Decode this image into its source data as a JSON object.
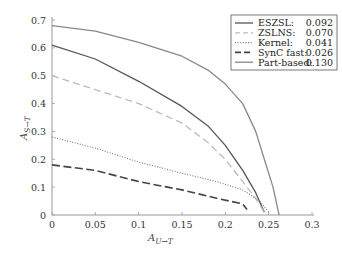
{
  "chart_data": {
    "type": "line",
    "title": "",
    "xlabel": "A_{U→T}",
    "ylabel": "A_{S→T}",
    "xlim": [
      0,
      0.3
    ],
    "ylim": [
      0,
      0.7
    ],
    "x_ticks": [
      "0",
      "0.05",
      "0.1",
      "0.15",
      "0.2",
      "0.25",
      "0.3"
    ],
    "y_ticks": [
      "0",
      "0.1",
      "0.2",
      "0.3",
      "0.4",
      "0.5",
      "0.6",
      "0.7"
    ],
    "grid": false,
    "legend_position": "upper right",
    "series": [
      {
        "name": "ESZSL:",
        "auc": "0.092",
        "style": "solid",
        "color": "#555555",
        "points": [
          [
            0,
            0.61
          ],
          [
            0.05,
            0.56
          ],
          [
            0.1,
            0.48
          ],
          [
            0.15,
            0.39
          ],
          [
            0.18,
            0.32
          ],
          [
            0.2,
            0.25
          ],
          [
            0.22,
            0.16
          ],
          [
            0.235,
            0.08
          ],
          [
            0.245,
            0.01
          ]
        ]
      },
      {
        "name": "ZSLNS:",
        "auc": "0.070",
        "style": "dashed",
        "color": "#bbbbbb",
        "points": [
          [
            0,
            0.5
          ],
          [
            0.05,
            0.45
          ],
          [
            0.1,
            0.4
          ],
          [
            0.15,
            0.33
          ],
          [
            0.18,
            0.26
          ],
          [
            0.2,
            0.2
          ],
          [
            0.22,
            0.12
          ],
          [
            0.235,
            0.06
          ],
          [
            0.245,
            0.01
          ]
        ]
      },
      {
        "name": "Kernel:",
        "auc": "0.041",
        "style": "dotted",
        "color": "#777777",
        "points": [
          [
            0,
            0.28
          ],
          [
            0.05,
            0.24
          ],
          [
            0.1,
            0.19
          ],
          [
            0.15,
            0.15
          ],
          [
            0.19,
            0.12
          ],
          [
            0.22,
            0.09
          ],
          [
            0.24,
            0.05
          ],
          [
            0.25,
            0.01
          ]
        ]
      },
      {
        "name": "SynC fast:",
        "auc": "0.026",
        "style": "longdash",
        "color": "#444444",
        "points": [
          [
            0,
            0.18
          ],
          [
            0.05,
            0.16
          ],
          [
            0.1,
            0.12
          ],
          [
            0.15,
            0.09
          ],
          [
            0.19,
            0.06
          ],
          [
            0.22,
            0.04
          ],
          [
            0.225,
            0.02
          ]
        ]
      },
      {
        "name": "Part-based:",
        "auc": "0.130",
        "style": "solid",
        "color": "#888888",
        "points": [
          [
            0,
            0.68
          ],
          [
            0.05,
            0.66
          ],
          [
            0.1,
            0.62
          ],
          [
            0.15,
            0.57
          ],
          [
            0.18,
            0.52
          ],
          [
            0.2,
            0.47
          ],
          [
            0.22,
            0.4
          ],
          [
            0.235,
            0.3
          ],
          [
            0.245,
            0.2
          ],
          [
            0.255,
            0.1
          ],
          [
            0.262,
            0
          ]
        ]
      }
    ]
  }
}
